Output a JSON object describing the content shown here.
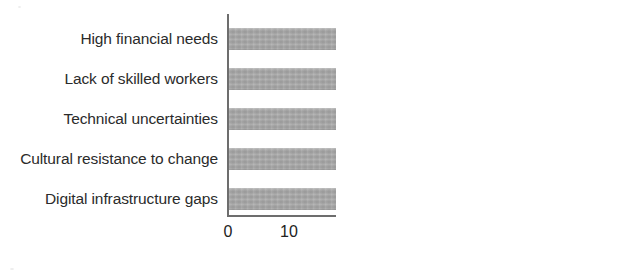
{
  "chart_data": {
    "type": "bar",
    "orientation": "horizontal",
    "title": "",
    "subtitle": "",
    "xlabel": "% of firms",
    "ylabel": "",
    "categories": [
      "High financial needs",
      "Lack of skilled workers",
      "Technical uncertainties",
      "Cultural resistance to change",
      "Digital infrastructure gaps"
    ],
    "values": [
      55,
      40,
      38,
      37,
      36
    ],
    "value_labels": [
      "55",
      "40",
      "38",
      "37",
      "36"
    ],
    "xlim": [
      0,
      60
    ],
    "xticks": [
      0,
      10,
      20,
      30,
      40,
      50,
      60
    ],
    "xtick_labels": [
      "0",
      "10",
      "20",
      "30",
      "40",
      "50",
      "60"
    ],
    "grid": false,
    "legend": false,
    "legend_position": "none",
    "series": [
      {
        "name": "% of firms",
        "values": [
          55,
          40,
          38,
          37,
          36
        ]
      }
    ],
    "colors": {
      "bar": "#a6a6a6",
      "axis": "#6d6d6d",
      "text": "#222222",
      "background": "#ffffff"
    }
  }
}
